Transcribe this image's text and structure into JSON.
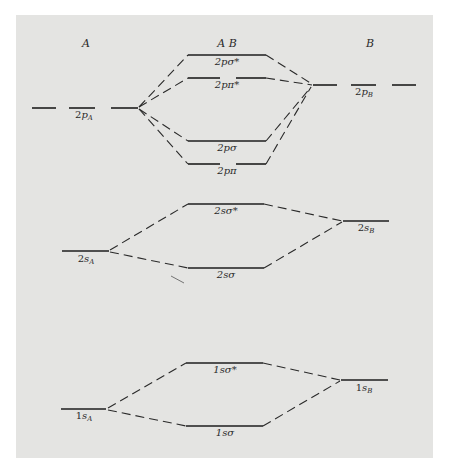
{
  "columns": {
    "left": "A",
    "center": "A B",
    "right": "B"
  },
  "atomic_orbitals": {
    "2pA": {
      "prefix": "2",
      "orb": "p",
      "sub": "A"
    },
    "2pB": {
      "prefix": "2",
      "orb": "p",
      "sub": "B"
    },
    "2sA": {
      "prefix": "2",
      "orb": "s",
      "sub": "A"
    },
    "2sB": {
      "prefix": "2",
      "orb": "s",
      "sub": "B"
    },
    "1sA": {
      "prefix": "1",
      "orb": "s",
      "sub": "A"
    },
    "1sB": {
      "prefix": "1",
      "orb": "s",
      "sub": "B"
    }
  },
  "molecular_orbitals": {
    "2psigma_star": "2pσ*",
    "2ppi_star": "2pπ*",
    "2psigma": "2pσ",
    "2ppi": "2pπ",
    "2ssigma_star": "2sσ*",
    "2ssigma": "2sσ",
    "1ssigma_star": "1sσ*",
    "1ssigma": "1sσ"
  },
  "colors": {
    "panel_background": "#e4e4e2",
    "page_background": "#ffffff",
    "line": "#1e1e1e"
  }
}
